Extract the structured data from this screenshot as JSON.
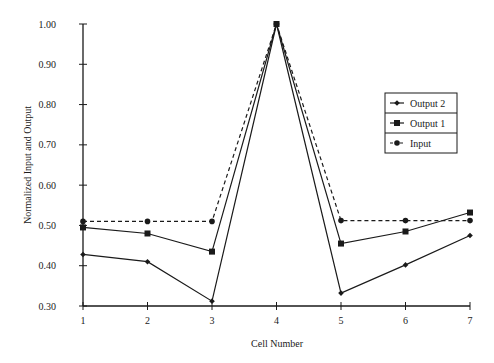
{
  "chart_data": {
    "type": "line",
    "title": "",
    "xlabel": "Cell Number",
    "ylabel": "Normalized Input and Output",
    "x": [
      1,
      2,
      3,
      4,
      5,
      6,
      7
    ],
    "x_tick_labels": [
      "1",
      "2",
      "3",
      "4",
      "5",
      "6",
      "7"
    ],
    "y_tick_labels": [
      "0.30",
      "0.40",
      "0.50",
      "0.60",
      "0.70",
      "0.80",
      "0.90",
      "1.00"
    ],
    "ylim": [
      0.3,
      1.0
    ],
    "xlim": [
      1,
      7
    ],
    "grid": false,
    "legend_position": "right, upper-middle",
    "series": [
      {
        "name": "Output 2",
        "marker": "diamond",
        "line": "solid",
        "values": [
          0.428,
          0.41,
          0.312,
          1.0,
          0.332,
          0.402,
          0.475
        ]
      },
      {
        "name": "Output 1",
        "marker": "square",
        "line": "solid",
        "values": [
          0.495,
          0.48,
          0.435,
          1.0,
          0.455,
          0.485,
          0.532
        ]
      },
      {
        "name": "Input",
        "marker": "circle",
        "line": "dashed",
        "values": [
          0.51,
          0.51,
          0.51,
          1.0,
          0.512,
          0.512,
          0.512
        ]
      }
    ]
  },
  "legend": {
    "items": [
      {
        "label": "Output 2"
      },
      {
        "label": "Output 1"
      },
      {
        "label": "Input"
      }
    ]
  },
  "colors": {
    "line": "#1a1a1a",
    "background": "#ffffff"
  }
}
